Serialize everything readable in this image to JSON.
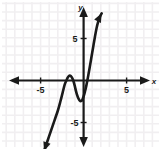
{
  "figure": {
    "width": 161,
    "height": 149,
    "background_color": "#ffffff",
    "grid_color": "#f0eef0",
    "axis_color": "#1a1a1a",
    "curve_color": "#1a1a1a"
  },
  "labels": {
    "x_axis": "x",
    "y_axis": "y",
    "x_tick_negative": "-5",
    "x_tick_positive": "5",
    "y_tick_positive": "5",
    "y_tick_negative": "-5"
  },
  "chart_data": {
    "type": "line",
    "title": "",
    "xlabel": "x",
    "ylabel": "y",
    "xlim": [
      -8.5,
      9
    ],
    "ylim": [
      -8.5,
      8
    ],
    "xticks": [
      -5,
      5
    ],
    "xtick_labels": [
      "-5",
      "5"
    ],
    "yticks": [
      5,
      -5
    ],
    "ytick_labels": [
      "5",
      "-5"
    ],
    "grid": true,
    "grid_spacing": 1,
    "legend": null,
    "legend_position": "none",
    "axis_arrows": [
      "left",
      "right",
      "up",
      "down"
    ],
    "series": [
      {
        "name": "polynomial",
        "description": "Quartic-like polynomial with a local maximum just above the x-axis near x=-1.6, a local minimum near x=-0.4 at about y=-2.4, roots near x=-2.2, -1.2, -0.05 and 0.6; falls steeply to the lower left and rises steeply to the upper right.",
        "x": [
          -4.6,
          -4.2,
          -3.8,
          -3.4,
          -3.0,
          -2.7,
          -2.45,
          -2.2,
          -2.0,
          -1.85,
          -1.7,
          -1.6,
          -1.5,
          -1.35,
          -1.2,
          -1.05,
          -0.9,
          -0.75,
          -0.6,
          -0.45,
          -0.3,
          -0.15,
          0.0,
          0.15,
          0.3,
          0.5,
          0.7,
          0.9,
          1.1,
          1.3,
          1.5,
          1.7,
          1.9,
          2.1
        ],
        "y": [
          -8.4,
          -7.2,
          -6.0,
          -4.8,
          -3.6,
          -2.5,
          -1.5,
          -0.5,
          0.0,
          0.35,
          0.55,
          0.6,
          0.55,
          0.35,
          0.0,
          -0.55,
          -1.2,
          -1.75,
          -2.15,
          -2.4,
          -2.45,
          -2.3,
          -1.9,
          -1.35,
          -0.7,
          0.35,
          1.5,
          2.7,
          3.9,
          5.1,
          6.2,
          7.0,
          7.6,
          8.0
        ],
        "roots": [
          -2.0,
          -1.2,
          -0.05
        ],
        "local_max": {
          "x": -1.6,
          "y": 0.6
        },
        "local_min": {
          "x": -0.35,
          "y": -2.45
        }
      }
    ]
  }
}
